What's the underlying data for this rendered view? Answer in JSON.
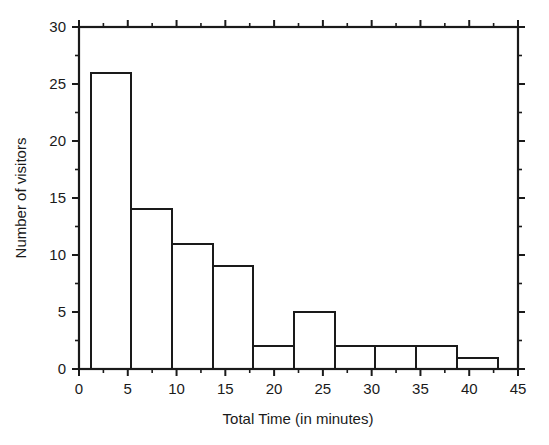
{
  "chart_data": {
    "type": "bar",
    "title": "",
    "subtitle": "",
    "xlabel": "Total Time (in minutes)",
    "ylabel": "Number of visitors",
    "xlim": [
      0,
      45
    ],
    "ylim": [
      0,
      30
    ],
    "grid": false,
    "legend": null,
    "legend_position": "none",
    "bin_width": 4.17,
    "bin_start": 1.2,
    "bin_edges": [
      1.2,
      5.37,
      9.54,
      13.71,
      17.88,
      22.05,
      26.22,
      30.39,
      34.56,
      38.73,
      42.9
    ],
    "categories": [
      "1.2-5.4",
      "5.4-9.5",
      "9.5-13.7",
      "13.7-17.9",
      "17.9-22.1",
      "22.1-26.2",
      "26.2-30.4",
      "30.4-34.6",
      "34.6-38.7",
      "38.7-42.9"
    ],
    "values": [
      26,
      14,
      11,
      9,
      2,
      5,
      2,
      2,
      2,
      1
    ],
    "x_ticks": [
      0,
      5,
      10,
      15,
      20,
      25,
      30,
      35,
      40,
      45
    ],
    "x_tick_labels": [
      "0",
      "5",
      "10",
      "15",
      "20",
      "25",
      "30",
      "35",
      "40",
      "45"
    ],
    "x_minor_tick_step": 2.5,
    "y_ticks": [
      0,
      5,
      10,
      15,
      20,
      25,
      30
    ],
    "y_tick_labels": [
      "0",
      "5",
      "10",
      "15",
      "20",
      "25",
      "30"
    ],
    "y_minor_tick_step": 2.5,
    "bar_style": "outline",
    "bar_fill_color": "#ffffff",
    "bar_edge_color": "#1a1a1a",
    "background_color": "#ffffff",
    "axis_color": "#1a1a1a"
  }
}
